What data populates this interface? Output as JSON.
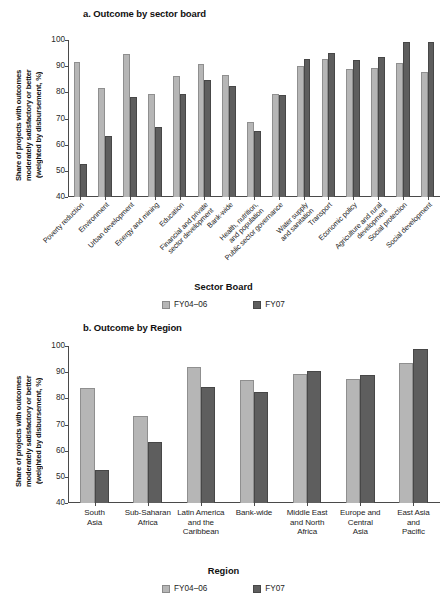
{
  "panel_a": {
    "title": "a. Outcome by sector board",
    "ylabel": "Share of projects with outcomes\nmoderately satisfactory or better\n(weighted by disbursement, %)",
    "xtitle": "Sector Board",
    "legend": [
      {
        "label": "FY04–06",
        "color": "#b6b6b6"
      },
      {
        "label": "FY07",
        "color": "#5e5e5e"
      }
    ]
  },
  "panel_b": {
    "title": "b. Outcome by Region",
    "ylabel": "Share of projects with outcomes\nmoderately satisfactory or better\n(weighted by disbursement, %)",
    "xtitle": "Region",
    "legend": [
      {
        "label": "FY04–06",
        "color": "#b6b6b6"
      },
      {
        "label": "FY07",
        "color": "#5e5e5e"
      }
    ]
  },
  "chart_data": [
    {
      "type": "bar",
      "title": "a. Outcome by sector board",
      "xlabel": "Sector Board",
      "ylabel": "Share of projects with outcomes moderately satisfactory or better (weighted by disbursement, %)",
      "ylim": [
        40,
        100
      ],
      "yticks": [
        40,
        50,
        60,
        70,
        80,
        90,
        100
      ],
      "grid": false,
      "legend_position": "bottom",
      "categories": [
        "Poverty reduction",
        "Environment",
        "Urban development",
        "Energy and mining",
        "Education",
        "Financial and private sector development",
        "Bank-wide",
        "Health, nutrition, and population",
        "Public sector governance",
        "Water supply and sanitation",
        "Transport",
        "Economic policy",
        "Agriculture and rural development",
        "Social protection",
        "Social development"
      ],
      "series": [
        {
          "name": "FY04–06",
          "color": "#b6b6b6",
          "values": [
            91.5,
            81.8,
            94.7,
            79.2,
            86.3,
            90.9,
            86.8,
            68.8,
            79.2,
            89.9,
            92.6,
            88.9,
            89.2,
            91.3,
            87.7
          ]
        },
        {
          "name": "FY07",
          "color": "#5e5e5e",
          "values": [
            52.6,
            63.3,
            78.4,
            66.9,
            79.2,
            84.9,
            82.4,
            65.4,
            79.1,
            92.6,
            95.2,
            92.4,
            93.6,
            99.4,
            99.3
          ]
        }
      ]
    },
    {
      "type": "bar",
      "title": "b. Outcome by Region",
      "xlabel": "Region",
      "ylabel": "Share of projects with outcomes moderately satisfactory or better (weighted by disbursement, %)",
      "ylim": [
        40,
        100
      ],
      "yticks": [
        40,
        50,
        60,
        70,
        80,
        90,
        100
      ],
      "grid": false,
      "legend_position": "bottom",
      "categories": [
        "South Asia",
        "Sub-Saharan Africa",
        "Latin America and the Caribbean",
        "Bank-wide",
        "Middle East and North Africa",
        "Europe and Central Asia",
        "East Asia and Pacific"
      ],
      "category_lines": [
        "South\nAsia",
        "Sub-Saharan\nAfrica",
        "Latin America\nand the\nCaribbean",
        "Bank-wide",
        "Middle East\nand North\nAfrica",
        "Europe and\nCentral\nAsia",
        "East Asia\nand\nPacific"
      ],
      "series": [
        {
          "name": "FY04–06",
          "color": "#b6b6b6",
          "values": [
            83.8,
            73.2,
            91.9,
            86.9,
            89.4,
            87.5,
            93.5
          ]
        },
        {
          "name": "FY07",
          "color": "#5e5e5e",
          "values": [
            52.7,
            63.3,
            84.2,
            82.3,
            90.4,
            88.8,
            98.8
          ]
        }
      ]
    }
  ]
}
